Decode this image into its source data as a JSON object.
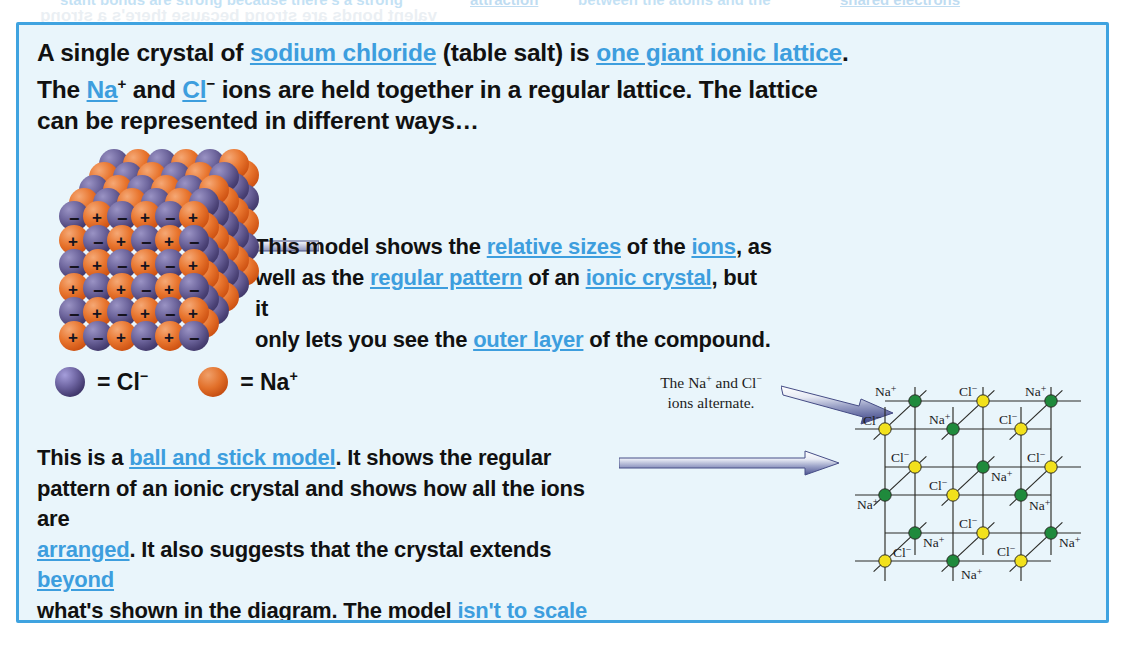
{
  "page": {
    "ghost_top": [
      {
        "text": "stant bonds are strong because there's a strong",
        "x": 60
      },
      {
        "text": "attraction",
        "x": 470,
        "keyword": true
      },
      {
        "text": "between the atoms and the",
        "x": 578
      },
      {
        "text": "shared electrons",
        "x": 840,
        "keyword": true
      }
    ],
    "box": {
      "border_color": "#3fa3e0",
      "background_color": "#e9f5fb"
    }
  },
  "intro_paragraph": {
    "segments": [
      {
        "t": "A single crystal of "
      },
      {
        "t": "sodium chloride",
        "kw": true
      },
      {
        "t": " (table salt) is "
      },
      {
        "t": "one giant ionic lattice",
        "kw": true
      },
      {
        "t": ".",
        "br": true
      },
      {
        "t": "The "
      },
      {
        "t": "Na",
        "kw": true
      },
      {
        "t": "+",
        "sup": true
      },
      {
        "t": " and "
      },
      {
        "t": "Cl",
        "kw": true
      },
      {
        "t": "−",
        "sup": true
      },
      {
        "t": " ions are held together in a regular lattice.  The lattice",
        "br": true
      },
      {
        "t": "can be represented in different ways…"
      }
    ]
  },
  "middle_paragraph": {
    "segments": [
      {
        "t": "This model shows the "
      },
      {
        "t": "relative sizes",
        "kw": true
      },
      {
        "t": " of the "
      },
      {
        "t": "ions",
        "kw": true
      },
      {
        "t": ", as",
        "br": true
      },
      {
        "t": "well as the "
      },
      {
        "t": "regular pattern",
        "kw": true
      },
      {
        "t": " of an "
      },
      {
        "t": "ionic crystal",
        "kw": true
      },
      {
        "t": ", but it",
        "br": true
      },
      {
        "t": "only lets you see the "
      },
      {
        "t": "outer layer",
        "kw": true
      },
      {
        "t": " of the compound."
      }
    ]
  },
  "lower_paragraph": {
    "segments": [
      {
        "t": "This is a "
      },
      {
        "t": "ball and stick model",
        "kw": true
      },
      {
        "t": ".  It shows the regular",
        "br": true
      },
      {
        "t": "pattern of an ionic crystal and shows how all the ions are",
        "br": true
      },
      {
        "t": "arranged",
        "kw": true
      },
      {
        "t": ".  It also suggests that the crystal extends "
      },
      {
        "t": "beyond",
        "kw": true
      },
      {
        "t": "",
        "br": true
      },
      {
        "t": "what's shown in the diagram.  The model "
      },
      {
        "t": "isn't to scale",
        "kw": true
      },
      {
        "t": "",
        "br": true
      },
      {
        "t": "though, so the relative sizes of the ions may not be shown.",
        "br": true
      },
      {
        "t": "Also, in reality, there aren't "
      },
      {
        "t": "gaps",
        "kw": true
      },
      {
        "t": " between the ions."
      }
    ]
  },
  "legend": {
    "chloride": {
      "symbol": "Cl",
      "charge": "−",
      "equals": "=",
      "color": "#4a4175",
      "ion_name": "chloride-ion"
    },
    "sodium": {
      "symbol": "Na",
      "charge": "+",
      "equals": "=",
      "color": "#e2702a",
      "ion_name": "sodium-ion"
    }
  },
  "crystal_model": {
    "name": "space-filling-sodium-chloride-crystal",
    "anion_sign": "−",
    "cation_sign": "+",
    "anion_color": "#4a4175",
    "cation_color": "#e2702a"
  },
  "annotation": {
    "line1_pre": "The Na",
    "line1_sup1": "+",
    "line1_mid": " and Cl",
    "line1_sup2": "−",
    "line2": "ions alternate."
  },
  "lattice_diagram": {
    "name": "ball-and-stick-nacl-lattice",
    "sodium_color": "#1f8a3c",
    "chloride_color": "#f2e11c",
    "bond_color": "#2a2a26",
    "nodes": [
      {
        "label": "Na",
        "charge": "+",
        "kind": "na",
        "x": 68,
        "y": 38,
        "lx": 28,
        "ly": 33,
        "anchor": "start"
      },
      {
        "label": "Cl",
        "charge": "−",
        "kind": "cl",
        "x": 136,
        "y": 38,
        "lx": 112,
        "ly": 33,
        "anchor": "start"
      },
      {
        "label": "Na",
        "charge": "+",
        "kind": "na",
        "x": 204,
        "y": 38,
        "lx": 178,
        "ly": 33,
        "anchor": "start"
      },
      {
        "label": "Cl",
        "charge": "−",
        "kind": "cl",
        "x": 38,
        "y": 66,
        "lx": 16,
        "ly": 62,
        "anchor": "start"
      },
      {
        "label": "Na",
        "charge": "+",
        "kind": "na",
        "x": 106,
        "y": 66,
        "lx": 82,
        "ly": 61,
        "anchor": "start"
      },
      {
        "label": "Cl",
        "charge": "−",
        "kind": "cl",
        "x": 174,
        "y": 66,
        "lx": 152,
        "ly": 61,
        "anchor": "start"
      },
      {
        "label": "Cl",
        "charge": "−",
        "kind": "cl",
        "x": 68,
        "y": 104,
        "lx": 44,
        "ly": 99,
        "anchor": "start"
      },
      {
        "label": "Na",
        "charge": "+",
        "kind": "na",
        "x": 136,
        "y": 104,
        "lx": 144,
        "ly": 118,
        "anchor": "start"
      },
      {
        "label": "Cl",
        "charge": "−",
        "kind": "cl",
        "x": 204,
        "y": 104,
        "lx": 180,
        "ly": 99,
        "anchor": "start"
      },
      {
        "label": "Na",
        "charge": "+",
        "kind": "na",
        "x": 38,
        "y": 132,
        "lx": 10,
        "ly": 146,
        "anchor": "start"
      },
      {
        "label": "Cl",
        "charge": "−",
        "kind": "cl",
        "x": 106,
        "y": 132,
        "lx": 82,
        "ly": 127,
        "anchor": "start"
      },
      {
        "label": "Na",
        "charge": "+",
        "kind": "na",
        "x": 174,
        "y": 132,
        "lx": 182,
        "ly": 147,
        "anchor": "start"
      },
      {
        "label": "Na",
        "charge": "+",
        "kind": "na",
        "x": 68,
        "y": 170,
        "lx": 76,
        "ly": 184,
        "anchor": "start"
      },
      {
        "label": "Cl",
        "charge": "−",
        "kind": "cl",
        "x": 136,
        "y": 170,
        "lx": 112,
        "ly": 165,
        "anchor": "start"
      },
      {
        "label": "Na",
        "charge": "+",
        "kind": "na",
        "x": 204,
        "y": 170,
        "lx": 212,
        "ly": 184,
        "anchor": "start"
      },
      {
        "label": "Cl",
        "charge": "−",
        "kind": "cl",
        "x": 38,
        "y": 198,
        "lx": 46,
        "ly": 194,
        "anchor": "start"
      },
      {
        "label": "Na",
        "charge": "+",
        "kind": "na",
        "x": 106,
        "y": 198,
        "lx": 114,
        "ly": 216,
        "anchor": "start"
      },
      {
        "label": "Cl",
        "charge": "−",
        "kind": "cl",
        "x": 174,
        "y": 198,
        "lx": 150,
        "ly": 193,
        "anchor": "start"
      }
    ]
  },
  "arrows": {
    "to_crystal_model": "arrow-pointing-to-space-filling-model",
    "to_lattice_top": "arrow-pointing-to-lattice-alternating-ions",
    "to_lattice_mid": "arrow-pointing-to-ball-and-stick-lattice"
  }
}
